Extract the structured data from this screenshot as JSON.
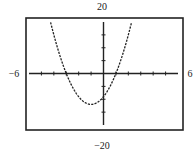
{
  "chart_data": {
    "type": "line",
    "title": "",
    "function": "y = 3x^2 + 6x - 9",
    "coefficients": {
      "a": 3,
      "b": 6,
      "c": -9
    },
    "xlim": [
      -6,
      6
    ],
    "ylim": [
      -20,
      20
    ],
    "xscl": 1,
    "yscl": 5,
    "grid": false,
    "window_labels": {
      "ymax": "20",
      "ymin": "−20",
      "xmin": "−6",
      "xmax": "6"
    },
    "series": [
      {
        "name": "parabola",
        "style": "dashed",
        "color": "#222222",
        "x_intercepts": [
          -3,
          1
        ],
        "y_intercept": -9,
        "vertex": [
          -1,
          -12
        ]
      }
    ]
  }
}
